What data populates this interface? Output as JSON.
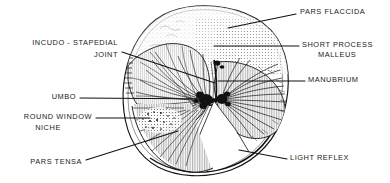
{
  "figure": {
    "ink_color": "#1a1a1a",
    "paper_color": "#ffffff",
    "shade_color": "#9a9a9a"
  },
  "labels": [
    {
      "id": "pars-flaccida",
      "text": "PARS FLACCIDA",
      "align": "left",
      "x": 300,
      "y": 11
    },
    {
      "id": "short-process",
      "text": "SHORT PROCESS",
      "align": "left",
      "x": 302,
      "y": 44
    },
    {
      "id": "malleus",
      "text": "MALLEUS",
      "align": "left",
      "x": 318,
      "y": 54
    },
    {
      "id": "manubrium",
      "text": "MANUBRIUM",
      "align": "left",
      "x": 308,
      "y": 79
    },
    {
      "id": "light-reflex",
      "text": "LIGHT REFLEX",
      "align": "left",
      "x": 290,
      "y": 157
    },
    {
      "id": "incudo-stapedial",
      "text": "INCUDO - STAPEDIAL",
      "align": "right",
      "x": 118,
      "y": 42
    },
    {
      "id": "joint",
      "text": "JOINT",
      "align": "right",
      "x": 118,
      "y": 54
    },
    {
      "id": "umbo",
      "text": "UMBO",
      "align": "right",
      "x": 76,
      "y": 96
    },
    {
      "id": "round-window",
      "text": "ROUND WINDOW",
      "align": "right",
      "x": 92,
      "y": 116
    },
    {
      "id": "niche",
      "text": "NICHE",
      "align": "right",
      "x": 92,
      "y": 127
    },
    {
      "id": "pars-tensa",
      "text": "PARS TENSA",
      "align": "right",
      "x": 82,
      "y": 161
    }
  ],
  "leader_lines": [
    {
      "id": "leader-pars-flaccida",
      "points": "296,14 228,28"
    },
    {
      "id": "leader-short-process",
      "points": "299,46 214,46"
    },
    {
      "id": "leader-manubrium",
      "points": "305,81 218,81"
    },
    {
      "id": "leader-light-reflex",
      "points": "287,159 239,150"
    },
    {
      "id": "leader-incudo-stapedial",
      "points": "122,52 215,83"
    },
    {
      "id": "leader-umbo",
      "points": "80,98 218,99"
    },
    {
      "id": "leader-round-window",
      "points": "96,118 150,118"
    },
    {
      "id": "leader-pars-tensa",
      "points": "86,160 178,131"
    }
  ],
  "structures": [
    {
      "id": "membrane-outline",
      "name": "tympanic-membrane-outline"
    },
    {
      "id": "pars-flaccida-zone",
      "name": "pars-flaccida-region"
    },
    {
      "id": "pars-tensa-zone",
      "name": "pars-tensa-region"
    },
    {
      "id": "left-quadrant-fan",
      "name": "posterior-fiber-fan"
    },
    {
      "id": "right-quadrant-fan",
      "name": "anterior-fiber-fan"
    },
    {
      "id": "umbo-point",
      "name": "umbo-center"
    },
    {
      "id": "cone-of-light",
      "name": "light-reflex-cone"
    }
  ]
}
